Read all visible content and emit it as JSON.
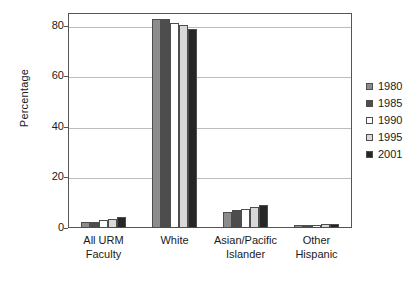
{
  "chart_data": {
    "type": "bar",
    "title": "",
    "xlabel": "",
    "ylabel": "Percentage",
    "ylim": [
      0,
      85
    ],
    "yticks": [
      0,
      20,
      40,
      60,
      80
    ],
    "ytick_labels": [
      "0",
      "20",
      "40",
      "60",
      "80"
    ],
    "grid": true,
    "legend_position": "right",
    "categories": [
      "All URM Faculty",
      "White",
      "Asian/Pacific Islander",
      "Other Hispanic"
    ],
    "category_lines": [
      [
        "All URM",
        "Faculty"
      ],
      [
        "White",
        ""
      ],
      [
        "Asian/Pacific",
        "Islander"
      ],
      [
        "Other",
        "Hispanic"
      ]
    ],
    "series": [
      {
        "name": "1980",
        "color": "#8c8c8c",
        "values": [
          2.4,
          82.6,
          6.3,
          1.2
        ]
      },
      {
        "name": "1985",
        "color": "#4d4d4d",
        "values": [
          2.4,
          82.6,
          7.0,
          1.3
        ]
      },
      {
        "name": "1990",
        "color": "#ffffff",
        "values": [
          3.0,
          81.2,
          7.5,
          1.3
        ]
      },
      {
        "name": "1995",
        "color": "#d9d9d9",
        "values": [
          3.4,
          80.2,
          8.5,
          1.4
        ]
      },
      {
        "name": "2001",
        "color": "#262626",
        "values": [
          4.2,
          78.6,
          9.0,
          1.5
        ]
      }
    ]
  },
  "legend": {
    "entries": [
      {
        "label": "1980",
        "color": "#8c8c8c"
      },
      {
        "label": "1985",
        "color": "#4d4d4d"
      },
      {
        "label": "1990",
        "color": "#ffffff"
      },
      {
        "label": "1995",
        "color": "#d9d9d9"
      },
      {
        "label": "2001",
        "color": "#262626"
      }
    ]
  },
  "axis": {
    "y_title": "Percentage"
  }
}
